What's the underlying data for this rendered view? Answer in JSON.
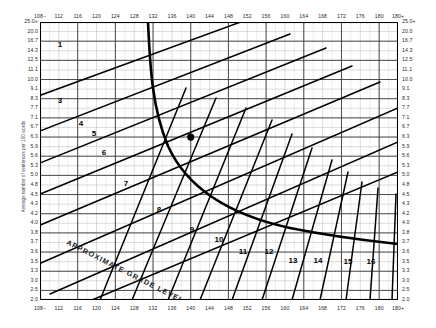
{
  "chart_data": {
    "type": "line",
    "title": "",
    "xlabel": "",
    "ylabel": "Average number of sentences per 100 words",
    "x_axis": {
      "position": "top-and-bottom",
      "tick_labels": [
        "108−",
        "112",
        "116",
        "120",
        "124",
        "128",
        "132",
        "136",
        "140",
        "144",
        "148",
        "152",
        "156",
        "160",
        "164",
        "168",
        "172",
        "176",
        "180",
        "180+"
      ],
      "minor_ticks_between": 1
    },
    "y_axis": {
      "position": "left-and-right",
      "tick_labels": [
        "25.0+",
        "20.0",
        "16.7",
        "14.3",
        "12.5",
        "11.1",
        "10.0",
        "9.1",
        "8.3",
        "7.7",
        "7.1",
        "6.7",
        "6.3",
        "5.9",
        "5.6",
        "5.3",
        "5.0",
        "4.8",
        "4.5",
        "4.3",
        "4.2",
        "4.0",
        "3.8",
        "3.7",
        "3.6",
        "3.5",
        "3.3",
        "3.0",
        "2.5",
        "2.0"
      ],
      "scale": "nonlinear"
    },
    "grid": true,
    "legend_position": "none",
    "bands": [
      {
        "label": "1",
        "x": 60,
        "y": 47
      },
      {
        "label": "2",
        "x": 38,
        "y": 85
      },
      {
        "label": "3",
        "x": 60,
        "y": 103
      },
      {
        "label": "4",
        "x": 81,
        "y": 126
      },
      {
        "label": "5",
        "x": 94,
        "y": 136
      },
      {
        "label": "6",
        "x": 104,
        "y": 155
      },
      {
        "label": "7",
        "x": 126,
        "y": 186
      },
      {
        "label": "8",
        "x": 159,
        "y": 212
      },
      {
        "label": "9",
        "x": 192,
        "y": 232
      },
      {
        "label": "10",
        "x": 219,
        "y": 242
      },
      {
        "label": "11",
        "x": 243,
        "y": 254
      },
      {
        "label": "12",
        "x": 269,
        "y": 254
      },
      {
        "label": "13",
        "x": 293,
        "y": 263
      },
      {
        "label": "14",
        "x": 318,
        "y": 263
      },
      {
        "label": "15",
        "x": 348,
        "y": 264
      },
      {
        "label": "16",
        "x": 371,
        "y": 264
      },
      {
        "label": "17+",
        "x": 404,
        "y": 272
      }
    ],
    "annotations": [
      {
        "text": "APPROXIMATE GRADE LEVEL",
        "rotation": 27
      }
    ],
    "points": [
      {
        "x": 140,
        "y": 6.3,
        "marker": "filled-circle"
      }
    ]
  },
  "axis": {
    "y_title": "Average number of sentences per 100 words"
  }
}
